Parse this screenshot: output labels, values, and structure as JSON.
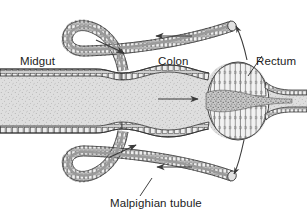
{
  "figure": {
    "width": 307,
    "height": 221,
    "background_color": "#ffffff",
    "ink_color": "#1c1c1c",
    "lumen_fill": "#d8d8d8",
    "wall_fill": "#c9c9c9"
  },
  "labels": {
    "midgut": "Midgut",
    "colon": "Colon",
    "rectum": "Rectum",
    "malpighian_tubule": "Malpighian tubule"
  },
  "structures": [
    {
      "name": "midgut",
      "label": "Midgut",
      "shape": "wide-straight-tube",
      "side": "left"
    },
    {
      "name": "colon",
      "label": "Colon",
      "shape": "bulging-tube",
      "side": "center"
    },
    {
      "name": "rectum",
      "label": "Rectum",
      "shape": "oval-bulb-with-rectal-pads",
      "side": "right"
    },
    {
      "name": "malpighian-tubule-upper",
      "label": "Malpighian tubule",
      "shape": "looped-tubule",
      "side": "top"
    },
    {
      "name": "malpighian-tubule-lower",
      "label": "Malpighian tubule",
      "shape": "looped-tubule",
      "side": "bottom"
    }
  ],
  "flow_arrows": [
    {
      "name": "arrow-upper-tubule-outward",
      "direction": "down-right",
      "location": "upper-tubule-left-bend"
    },
    {
      "name": "arrow-upper-tubule-return",
      "direction": "left",
      "location": "upper-tubule-right-run"
    },
    {
      "name": "arrow-gut-lumen",
      "direction": "right",
      "location": "colon-lumen-center"
    },
    {
      "name": "arrow-lower-tubule-outward",
      "direction": "up-right",
      "location": "lower-tubule-left-bend"
    },
    {
      "name": "arrow-lower-tubule-return",
      "direction": "left",
      "location": "lower-tubule-right-run"
    },
    {
      "name": "arrow-rectum-to-upper-tubule",
      "direction": "curved-up-left",
      "location": "right-of-rectum-top"
    },
    {
      "name": "arrow-rectum-to-lower-tubule",
      "direction": "curved-down-left",
      "location": "right-of-rectum-bottom"
    }
  ],
  "leader_lines": [
    {
      "name": "leader-rectum",
      "from_label": "Rectum",
      "to_structure": "rectum"
    },
    {
      "name": "leader-malpighian",
      "from_label": "Malpighian tubule",
      "to_structure": "malpighian-tubule-lower"
    }
  ]
}
